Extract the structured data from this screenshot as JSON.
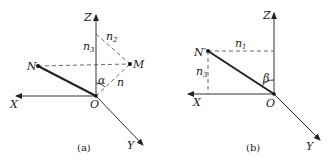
{
  "figure_a": {
    "caption": "(a)",
    "axes": {
      "x": "X",
      "y": "Y",
      "z": "Z"
    },
    "origin": "O",
    "points": {
      "N": "N",
      "M": "M"
    },
    "labels": {
      "n3": {
        "base": "n",
        "sub": "3"
      },
      "n2": {
        "base": "n",
        "sub": "2"
      },
      "n": "n",
      "alpha": "α"
    }
  },
  "figure_b": {
    "caption": "(b)",
    "axes": {
      "x": "X",
      "y": "Y",
      "z": "Z"
    },
    "origin": "O",
    "points": {
      "N_prime": "N′"
    },
    "labels": {
      "n1": {
        "base": "n",
        "sub": "1"
      },
      "n3": {
        "base": "n",
        "sub": "3"
      },
      "beta": "β"
    }
  }
}
